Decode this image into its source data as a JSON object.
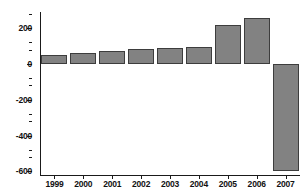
{
  "chart_data": {
    "type": "bar",
    "title": "",
    "subtitle": "",
    "xlabel": "",
    "ylabel": "",
    "categories": [
      "1999",
      "2000",
      "2001",
      "2002",
      "2003",
      "2004",
      "2005",
      "2006",
      "2007"
    ],
    "values": [
      50,
      60,
      75,
      85,
      90,
      95,
      215,
      255,
      -600
    ],
    "series": [
      {
        "name": "",
        "values": [
          50,
          60,
          75,
          85,
          90,
          95,
          215,
          255,
          -600
        ]
      }
    ],
    "ylim": [
      -620,
      290
    ],
    "yticks": [
      200,
      0,
      -200,
      -400,
      -600
    ],
    "ytick_labels": [
      "200",
      "0",
      "-200",
      "-400",
      "-600"
    ],
    "yticks_minor": [
      280,
      120,
      80,
      -80,
      -120,
      -280,
      -320,
      -480,
      -520
    ],
    "grid": false,
    "legend": null,
    "legend_position": "none",
    "bar_color": "#828282",
    "bar_edge_color": "#3d3d3d",
    "axis_color": "#1a1a1a",
    "background_color": "#ffffff",
    "zero_line": 0,
    "annotations": []
  }
}
